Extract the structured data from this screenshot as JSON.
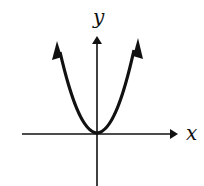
{
  "diagram": {
    "type": "graph-of-function",
    "axes": {
      "x_label": "x",
      "y_label": "y"
    },
    "curve": {
      "shape": "parabola",
      "vertex": "origin",
      "opens": "up",
      "arrowheads": "both ends"
    },
    "colors": {
      "stroke": "#111111",
      "background": "#ffffff"
    }
  }
}
